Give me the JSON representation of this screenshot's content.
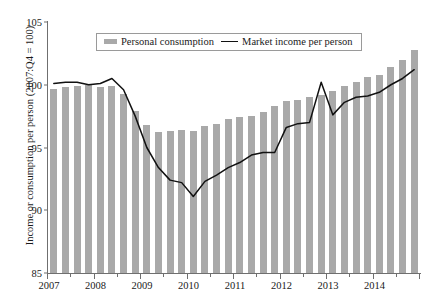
{
  "figure": {
    "title_sliver": "",
    "ylabel": "Income or consumption per person (2007:Q4 = 100)",
    "legend": {
      "bar_label": "Personal consumption",
      "line_label": "Market income per person"
    }
  },
  "chart_data": {
    "type": "bar",
    "title": "",
    "xlabel": "",
    "ylabel": "Income or consumption per person (2007:Q4 = 100)",
    "ylim": [
      85,
      105
    ],
    "yticks": [
      85,
      90,
      95,
      100,
      105
    ],
    "xlim_labels": [
      "2007",
      "2008",
      "2009",
      "2010",
      "2011",
      "2012",
      "2013",
      "2014"
    ],
    "xtick_labels": [
      "2007",
      "2008",
      "2009",
      "2010",
      "2011",
      "2012",
      "2013",
      "2014"
    ],
    "grid": false,
    "legend_position": "top-center",
    "bar_color": "#a9a9a9",
    "line_color": "#111111",
    "x": [
      "2007:Q1",
      "2007:Q2",
      "2007:Q3",
      "2007:Q4",
      "2008:Q1",
      "2008:Q2",
      "2008:Q3",
      "2008:Q4",
      "2009:Q1",
      "2009:Q2",
      "2009:Q3",
      "2009:Q4",
      "2010:Q1",
      "2010:Q2",
      "2010:Q3",
      "2010:Q4",
      "2011:Q1",
      "2011:Q2",
      "2011:Q3",
      "2011:Q4",
      "2012:Q1",
      "2012:Q2",
      "2012:Q3",
      "2012:Q4",
      "2013:Q1",
      "2013:Q2",
      "2013:Q3",
      "2013:Q4",
      "2014:Q1",
      "2014:Q2",
      "2014:Q3",
      "2014:Q4"
    ],
    "series": [
      {
        "name": "Personal consumption",
        "type": "bar",
        "values": [
          99.7,
          99.8,
          99.9,
          100.0,
          99.8,
          99.9,
          99.3,
          97.9,
          96.8,
          96.2,
          96.3,
          96.4,
          96.3,
          96.7,
          96.9,
          97.3,
          97.4,
          97.5,
          97.8,
          98.3,
          98.7,
          98.8,
          99.0,
          99.2,
          99.5,
          99.9,
          100.2,
          100.6,
          100.8,
          101.4,
          102.0,
          102.8
        ]
      },
      {
        "name": "Market income per person",
        "type": "line",
        "values": [
          100.1,
          100.2,
          100.2,
          100.0,
          100.1,
          100.5,
          99.6,
          97.5,
          95.0,
          93.4,
          92.4,
          92.2,
          91.1,
          92.3,
          92.8,
          93.4,
          93.8,
          94.4,
          94.6,
          94.6,
          96.6,
          96.9,
          97.0,
          100.2,
          97.6,
          98.6,
          99.0,
          99.1,
          99.4,
          100.0,
          100.5,
          101.2
        ]
      }
    ]
  }
}
